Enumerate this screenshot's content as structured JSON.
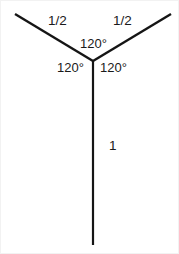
{
  "figure": {
    "kind": "geometry-diagram",
    "background_color": "#ffffff",
    "stroke_color": "#151515",
    "border_color": "#f2f2f2",
    "canvas": {
      "width": 179,
      "height": 254
    },
    "vertex": {
      "x": 92,
      "y": 60
    },
    "segments": [
      {
        "name": "left-arm",
        "from": {
          "x": 92,
          "y": 60
        },
        "to": {
          "x": 14,
          "y": 13
        },
        "length_label": "1/2"
      },
      {
        "name": "right-arm",
        "from": {
          "x": 92,
          "y": 60
        },
        "to": {
          "x": 170,
          "y": 13
        },
        "length_label": "1/2"
      },
      {
        "name": "vertical-stem",
        "from": {
          "x": 92,
          "y": 60
        },
        "to": {
          "x": 92,
          "y": 244
        },
        "length_label": "1"
      }
    ],
    "angles": [
      {
        "name": "top",
        "label": "120°",
        "between": [
          "left-arm",
          "right-arm"
        ]
      },
      {
        "name": "left",
        "label": "120°",
        "between": [
          "left-arm",
          "vertical-stem"
        ]
      },
      {
        "name": "right",
        "label": "120°",
        "between": [
          "right-arm",
          "vertical-stem"
        ]
      }
    ],
    "labels": {
      "left_length": "1/2",
      "right_length": "1/2",
      "stem_length": "1",
      "angle_top": "120°",
      "angle_left": "120°",
      "angle_right": "120°"
    }
  }
}
